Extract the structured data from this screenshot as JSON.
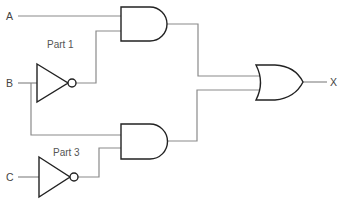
{
  "diagram": {
    "type": "logic-circuit",
    "inputs": [
      {
        "id": "A",
        "label": "A"
      },
      {
        "id": "B",
        "label": "B"
      },
      {
        "id": "C",
        "label": "C"
      }
    ],
    "output": {
      "id": "X",
      "label": "X"
    },
    "annotations": [
      {
        "id": "part1",
        "label": "Part 1"
      },
      {
        "id": "part3",
        "label": "Part 3"
      }
    ],
    "gates": [
      {
        "id": "not1",
        "type": "NOT",
        "inputs": [
          "B"
        ]
      },
      {
        "id": "not2",
        "type": "NOT",
        "inputs": [
          "C"
        ]
      },
      {
        "id": "and1",
        "type": "AND",
        "inputs": [
          "A",
          "not1"
        ]
      },
      {
        "id": "and2",
        "type": "AND",
        "inputs": [
          "B",
          "not2"
        ]
      },
      {
        "id": "or1",
        "type": "OR",
        "inputs": [
          "and1",
          "and2"
        ],
        "output": "X"
      }
    ],
    "expression": "X = (A AND NOT B) OR (B AND NOT C)"
  }
}
